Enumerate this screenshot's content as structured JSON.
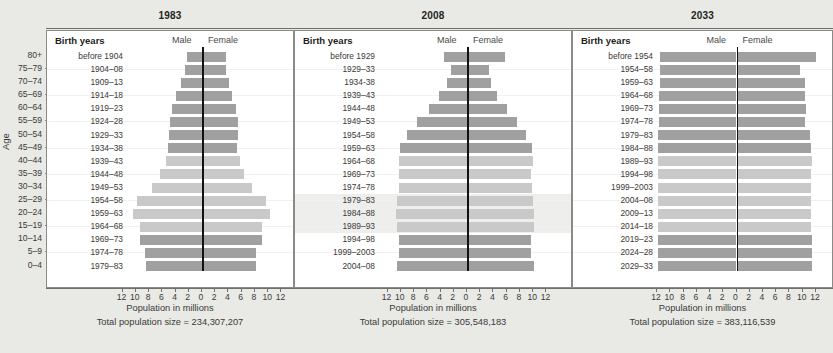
{
  "figure": {
    "age_axis_title": "Age",
    "x_axis_title": "Population in millions",
    "header_birth_years": "Birth years",
    "header_male": "Male",
    "header_female": "Female",
    "tick_labels": [
      "12",
      "10",
      "8",
      "6",
      "4",
      "2",
      "0",
      "2",
      "4",
      "6",
      "8",
      "10",
      "12"
    ],
    "tick_values": [
      -12,
      -10,
      -8,
      -6,
      -4,
      -2,
      0,
      2,
      4,
      6,
      8,
      10,
      12
    ],
    "age_groups": [
      "80+",
      "75–79",
      "70–74",
      "65–69",
      "60–64",
      "55–59",
      "50–54",
      "45–49",
      "40–44",
      "35–39",
      "30–34",
      "25–29",
      "20–24",
      "15–19",
      "10–14",
      "5–9",
      "0–4"
    ],
    "colors": {
      "dark_gray_bar": "#a0a0a0",
      "light_gray_bar": "#c9c9c9",
      "center_line": "#111111",
      "page_background": "#e9e9e6",
      "plot_background": "#ffffff",
      "highlight_band": "#eeeeec"
    }
  },
  "chart_data": {
    "type": "bar",
    "xlabel": "Population in millions",
    "ylabel": "Age",
    "xlim": [
      -12,
      12
    ],
    "grid": false,
    "legend": [
      "Male",
      "Female"
    ],
    "categories": [
      "80+",
      "75–79",
      "70–74",
      "65–69",
      "60–64",
      "55–59",
      "50–54",
      "45–49",
      "40–44",
      "35–39",
      "30–34",
      "25–29",
      "20–24",
      "15–19",
      "10–14",
      "5–9",
      "0–4"
    ],
    "panels": [
      {
        "year": "1983",
        "total_population_label": "Total population size = 234,307,207",
        "total_population": 234307207,
        "birth_years": [
          "before 1904",
          "1904–08",
          "1909–13",
          "1914–18",
          "1919–23",
          "1924–28",
          "1929–33",
          "1934–38",
          "1939–43",
          "1944–48",
          "1949–53",
          "1954–58",
          "1959–63",
          "1964–68",
          "1969–73",
          "1974–78",
          "1979–83"
        ],
        "shade": [
          "dark",
          "dark",
          "dark",
          "dark",
          "dark",
          "dark",
          "dark",
          "dark",
          "light",
          "light",
          "light",
          "light",
          "light",
          "light",
          "dark",
          "dark",
          "dark"
        ],
        "highlight": [
          false,
          false,
          false,
          false,
          false,
          false,
          false,
          false,
          false,
          false,
          false,
          false,
          false,
          false,
          false,
          false,
          false
        ],
        "male": [
          2.3,
          2.6,
          3.2,
          3.9,
          4.6,
          4.9,
          5.0,
          5.1,
          5.5,
          6.3,
          7.5,
          9.8,
          10.4,
          9.3,
          9.3,
          8.6,
          8.5
        ],
        "female": [
          3.7,
          3.6,
          4.1,
          4.6,
          5.2,
          5.4,
          5.4,
          5.3,
          5.7,
          6.4,
          7.5,
          9.6,
          10.2,
          9.1,
          9.0,
          8.2,
          8.1
        ]
      },
      {
        "year": "2008",
        "total_population_label": "Total population size = 305,548,183",
        "total_population": 305548183,
        "birth_years": [
          "before 1929",
          "1929–33",
          "1934-38",
          "1939–43",
          "1944–48",
          "1949–53",
          "1954–58",
          "1959–63",
          "1964–68",
          "1969–73",
          "1974–78",
          "1979–83",
          "1984–88",
          "1989–93",
          "1994–98",
          "1999–2003",
          "2004–08"
        ],
        "shade": [
          "dark",
          "dark",
          "dark",
          "dark",
          "dark",
          "dark",
          "dark",
          "dark",
          "light",
          "light",
          "light",
          "light",
          "light",
          "light",
          "dark",
          "dark",
          "dark"
        ],
        "highlight": [
          false,
          false,
          false,
          false,
          false,
          false,
          false,
          false,
          false,
          false,
          false,
          true,
          true,
          true,
          false,
          false,
          false
        ],
        "male": [
          3.5,
          2.4,
          3.0,
          4.2,
          5.8,
          7.5,
          9.1,
          10.1,
          10.3,
          10.2,
          10.3,
          10.6,
          10.7,
          10.6,
          10.2,
          10.2,
          10.6
        ],
        "female": [
          5.8,
          3.3,
          3.6,
          4.6,
          6.1,
          7.5,
          8.9,
          9.8,
          9.9,
          9.7,
          9.8,
          10.0,
          10.1,
          10.1,
          9.7,
          9.7,
          10.1
        ]
      },
      {
        "year": "2033",
        "total_population_label": "Total population size = 383,116,539",
        "total_population": 383116539,
        "birth_years": [
          "before 1954",
          "1954–58",
          "1959–63",
          "1964–68",
          "1969–73",
          "1974–78",
          "1979–83",
          "1984–88",
          "1989–93",
          "1994–98",
          "1999–2003",
          "2004–08",
          "2009–13",
          "2014–18",
          "2019–23",
          "2024–28",
          "2029–33"
        ],
        "shade": [
          "dark",
          "dark",
          "dark",
          "dark",
          "dark",
          "dark",
          "dark",
          "dark",
          "light",
          "light",
          "light",
          "light",
          "light",
          "light",
          "dark",
          "dark",
          "dark"
        ],
        "highlight": [
          false,
          false,
          false,
          false,
          false,
          false,
          false,
          false,
          false,
          false,
          false,
          false,
          false,
          false,
          false,
          false,
          false
        ],
        "male": [
          11.6,
          11.5,
          11.6,
          11.7,
          11.7,
          11.7,
          11.8,
          11.9,
          11.9,
          11.9,
          11.9,
          11.9,
          11.9,
          11.9,
          11.9,
          11.9,
          11.9
        ],
        "female": [
          12.0,
          9.6,
          10.3,
          10.3,
          10.5,
          10.4,
          11.1,
          11.2,
          11.4,
          11.2,
          11.3,
          11.3,
          11.3,
          11.3,
          11.4,
          11.4,
          11.4
        ]
      }
    ]
  }
}
